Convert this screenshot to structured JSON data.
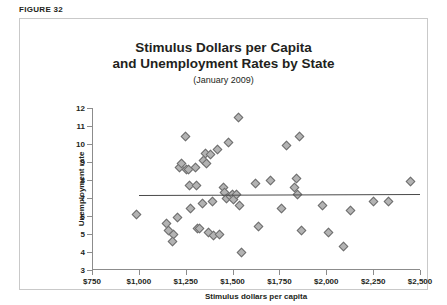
{
  "figure": {
    "label": "FIGURE 32"
  },
  "chart_data": {
    "type": "scatter",
    "title_line1": "Stimulus Dollars per Capita",
    "title_line2": "and Unemployment Rates by State",
    "subtitle": "(January 2009)",
    "xlabel": "Stimulus dollars per capita",
    "ylabel": "Unemployment rate",
    "xlim": [
      750,
      2500
    ],
    "ylim": [
      3,
      12
    ],
    "xticks": [
      750,
      1000,
      1250,
      1500,
      1750,
      2000,
      2250,
      2500
    ],
    "xticklabels": [
      "$750",
      "$1,000",
      "$1,250",
      "$1,500",
      "$1,750",
      "$2,000",
      "$2,250",
      "$2,500"
    ],
    "yticks": [
      3,
      4,
      5,
      6,
      7,
      8,
      9,
      10,
      11,
      12
    ],
    "yticklabels": [
      "3",
      "4",
      "5",
      "6",
      "7",
      "8",
      "9",
      "10",
      "11",
      "12"
    ],
    "grid": false,
    "legend": "none",
    "marker": "diamond",
    "marker_fill": "#b3b3b3",
    "marker_edge": "#6e6e6e",
    "points": [
      [
        985,
        6.1
      ],
      [
        1150,
        5.6
      ],
      [
        1160,
        5.2
      ],
      [
        1185,
        5.0
      ],
      [
        1180,
        4.6
      ],
      [
        1205,
        5.9
      ],
      [
        1215,
        8.7
      ],
      [
        1225,
        8.9
      ],
      [
        1250,
        10.4
      ],
      [
        1255,
        8.6
      ],
      [
        1265,
        8.6
      ],
      [
        1270,
        7.7
      ],
      [
        1275,
        6.4
      ],
      [
        1300,
        8.7
      ],
      [
        1305,
        7.7
      ],
      [
        1315,
        5.3
      ],
      [
        1325,
        5.3
      ],
      [
        1340,
        6.7
      ],
      [
        1345,
        9.1
      ],
      [
        1355,
        9.5
      ],
      [
        1360,
        8.9
      ],
      [
        1370,
        5.1
      ],
      [
        1380,
        9.4
      ],
      [
        1395,
        6.8
      ],
      [
        1400,
        4.9
      ],
      [
        1420,
        9.7
      ],
      [
        1430,
        5.0
      ],
      [
        1450,
        7.6
      ],
      [
        1455,
        7.3
      ],
      [
        1465,
        7.0
      ],
      [
        1480,
        10.1
      ],
      [
        1490,
        7.1
      ],
      [
        1500,
        7.2
      ],
      [
        1505,
        6.9
      ],
      [
        1520,
        7.2
      ],
      [
        1530,
        11.5
      ],
      [
        1535,
        6.6
      ],
      [
        1545,
        4.0
      ],
      [
        1620,
        7.8
      ],
      [
        1640,
        5.4
      ],
      [
        1700,
        8.0
      ],
      [
        1760,
        6.4
      ],
      [
        1790,
        9.9
      ],
      [
        1830,
        7.6
      ],
      [
        1840,
        8.1
      ],
      [
        1845,
        7.2
      ],
      [
        1855,
        10.4
      ],
      [
        1870,
        5.2
      ],
      [
        1980,
        6.6
      ],
      [
        2010,
        5.1
      ],
      [
        2090,
        4.3
      ],
      [
        2130,
        6.3
      ],
      [
        2250,
        6.8
      ],
      [
        2330,
        6.8
      ],
      [
        2450,
        7.9
      ]
    ],
    "trendline": {
      "x0": 1000,
      "x1": 2500,
      "y0": 7.18,
      "y1": 7.24,
      "color": "#4a4a4a"
    }
  }
}
